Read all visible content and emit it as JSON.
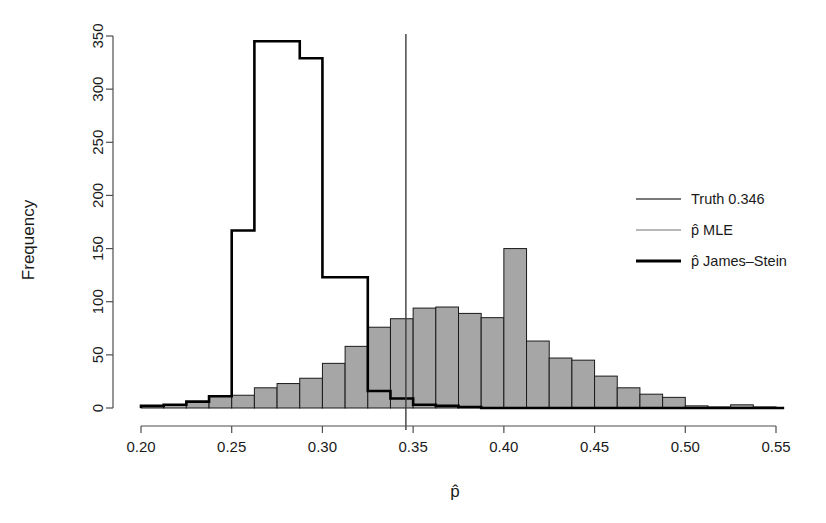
{
  "chart_data": {
    "type": "bar",
    "title": "",
    "subtitle": "",
    "xlabel": "p̂",
    "ylabel": "Frequency",
    "xlim": [
      0.1995,
      0.5545
    ],
    "ylim": [
      0,
      360
    ],
    "grid": false,
    "legend_position": "right",
    "x_ticks": [
      0.2,
      0.25,
      0.3,
      0.35,
      0.4,
      0.45,
      0.5,
      0.55
    ],
    "x_tick_labels": [
      "0.20",
      "0.25",
      "0.30",
      "0.35",
      "0.40",
      "0.45",
      "0.50",
      "0.55"
    ],
    "y_ticks": [
      0,
      50,
      100,
      150,
      200,
      250,
      300,
      350
    ],
    "y_tick_labels": [
      "0",
      "50",
      "100",
      "150",
      "200",
      "250",
      "300",
      "350"
    ],
    "bin_width": 0.0125,
    "series": [
      {
        "name": "p̂ MLE",
        "kind": "histogram-filled",
        "color": "#a6a6a6",
        "edge_color": "#1a1a1a",
        "bin_starts": [
          0.2,
          0.2125,
          0.225,
          0.2375,
          0.25,
          0.2625,
          0.275,
          0.2875,
          0.3,
          0.3125,
          0.325,
          0.3375,
          0.35,
          0.3625,
          0.375,
          0.3875,
          0.4,
          0.4125,
          0.425,
          0.4375,
          0.45,
          0.4625,
          0.475,
          0.4875,
          0.5,
          0.5125,
          0.525,
          0.5375
        ],
        "values": [
          2,
          3,
          6,
          11,
          12,
          19,
          23,
          28,
          42,
          58,
          76,
          84,
          94,
          95,
          89,
          85,
          150,
          63,
          47,
          45,
          30,
          19,
          13,
          10,
          2,
          1,
          3,
          1
        ]
      },
      {
        "name": "p̂ James–Stein",
        "kind": "histogram-outline",
        "color": "#000000",
        "bin_starts": [
          0.2,
          0.2125,
          0.225,
          0.2375,
          0.25,
          0.2625,
          0.275,
          0.2875,
          0.3,
          0.3125,
          0.325,
          0.3375,
          0.35,
          0.3625,
          0.375
        ],
        "values": [
          2,
          3,
          6,
          11,
          167,
          345,
          345,
          329,
          123,
          123,
          16,
          9,
          3,
          2,
          1
        ]
      },
      {
        "name": "Truth 0.346",
        "kind": "vline",
        "color": "#3d3d3d",
        "value": 0.346
      }
    ],
    "legend": [
      {
        "label": "Truth 0.346",
        "color": "#4d4d4d",
        "width": 1.6
      },
      {
        "label": "p̂ MLE",
        "color": "#b8b8b8",
        "width": 2.2
      },
      {
        "label": "p̂ James–Stein",
        "color": "#000000",
        "width": 3.2
      }
    ]
  },
  "axes": {
    "y_title": "Frequency",
    "x_title": "p̂"
  }
}
